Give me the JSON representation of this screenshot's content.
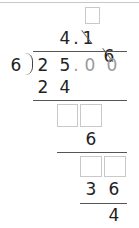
{
  "division": {
    "divisor": "6",
    "dividend": [
      "2",
      "5",
      ".",
      "0",
      "0"
    ],
    "quotient": [
      "4",
      ".",
      "1",
      "6"
    ],
    "quotient_struck": [
      false,
      false,
      true,
      true
    ],
    "steps": [
      {
        "subtract": [
          "2",
          "4"
        ]
      },
      {
        "remainder": "6"
      },
      {
        "subtract": [
          "3",
          "6"
        ]
      },
      {
        "remainder": "4"
      }
    ],
    "answer_boxes": {
      "quotient_box_count": 1,
      "step1_box_count": 2,
      "step2_box_count": 2
    }
  },
  "colors": {
    "digit": "#222222",
    "placeholder_digit": "#9a9a9a",
    "box_border": "#c9c9c9",
    "rule": "#555555"
  }
}
